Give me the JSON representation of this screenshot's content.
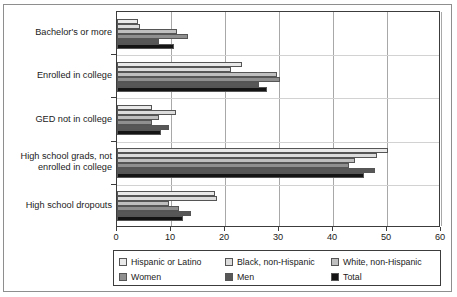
{
  "chart_data": {
    "type": "bar",
    "orientation": "horizontal",
    "title": "",
    "xlabel": "",
    "ylabel": "",
    "xlim": [
      0,
      60
    ],
    "xticks": [
      0,
      10,
      20,
      30,
      40,
      50,
      60
    ],
    "grid": true,
    "legend_position": "bottom",
    "categories": [
      "Bachelor's or more",
      "Enrolled in college",
      "GED not in college",
      "High school grads, not\nenrolled in college",
      "High school dropouts"
    ],
    "series": [
      {
        "name": "Hispanic or Latino",
        "color": "#e9e9e9",
        "values": [
          3.9,
          23.1,
          6.5,
          50.2,
          18.1
        ]
      },
      {
        "name": "Black, non-Hispanic",
        "color": "#dcdcdc",
        "values": [
          4.3,
          21.1,
          10.9,
          48.1,
          18.5
        ]
      },
      {
        "name": "White, non-Hispanic",
        "color": "#bfbfbf",
        "values": [
          11.1,
          29.6,
          7.8,
          44.1,
          9.6
        ]
      },
      {
        "name": "Women",
        "color": "#8f8f8f",
        "values": [
          13.1,
          30.2,
          6.5,
          43.0,
          11.5
        ]
      },
      {
        "name": "Men",
        "color": "#575757",
        "values": [
          7.8,
          26.3,
          9.6,
          47.8,
          13.7
        ]
      },
      {
        "name": "Total",
        "color": "#141414",
        "values": [
          10.5,
          27.8,
          8.1,
          45.7,
          12.2
        ]
      }
    ]
  },
  "axis": {
    "tick_labels": [
      "0",
      "10",
      "20",
      "30",
      "40",
      "50",
      "60"
    ]
  },
  "legend": {
    "entries": [
      {
        "label": "Hispanic or Latino",
        "color": "#e9e9e9"
      },
      {
        "label": "Black, non-Hispanic",
        "color": "#dcdcdc"
      },
      {
        "label": "White, non-Hispanic",
        "color": "#bfbfbf"
      },
      {
        "label": "Women",
        "color": "#8f8f8f"
      },
      {
        "label": "Men",
        "color": "#575757"
      },
      {
        "label": "Total",
        "color": "#141414"
      }
    ]
  }
}
